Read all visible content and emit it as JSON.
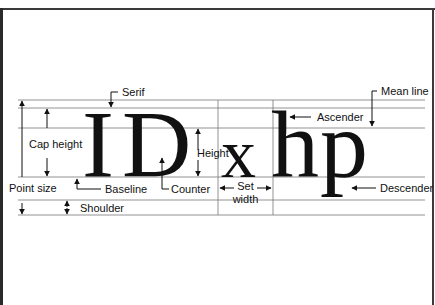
{
  "diagram": {
    "specimen": {
      "caps": "ID",
      "lower": [
        "x",
        "h",
        "p"
      ]
    },
    "labels": {
      "serif": "Serif",
      "mean_line": "Mean line",
      "ascender": "Ascender",
      "cap_height": "Cap height",
      "height": "Height",
      "point_size": "Point size",
      "baseline": "Baseline",
      "counter": "Counter",
      "set": "Set",
      "width": "width",
      "descender": "Descender",
      "shoulder": "Shoulder"
    },
    "colors": {
      "ink": "#111111",
      "rule": "#777777",
      "border": "#3a3a3a",
      "background": "#ffffff"
    }
  }
}
